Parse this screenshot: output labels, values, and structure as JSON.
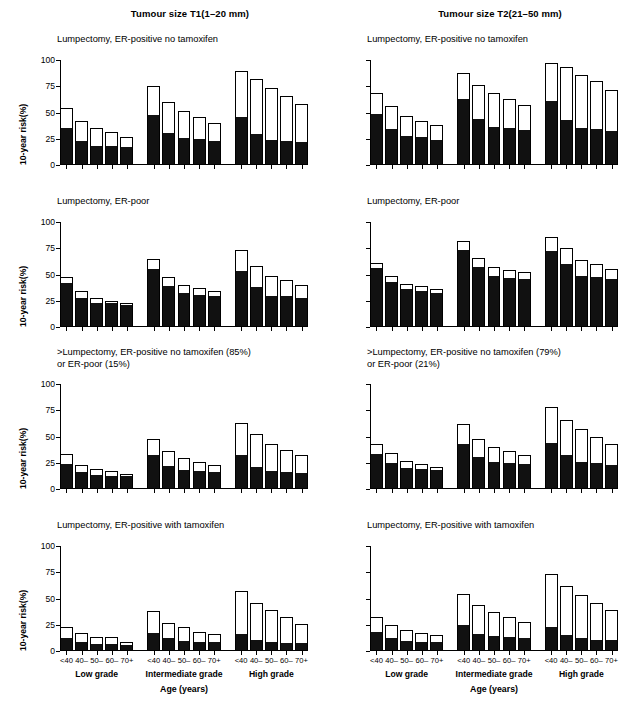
{
  "figure": {
    "columns": [
      {
        "title": "Tumour size T1(1–20 mm)"
      },
      {
        "title": "Tumour size T2(21–50 mm)"
      }
    ],
    "y_axis": {
      "label": "10-year risk(%)",
      "ticks": [
        "0",
        "25",
        "50",
        "75",
        "100"
      ],
      "min": 0,
      "max": 100
    },
    "x_axis": {
      "title": "Age (years)",
      "age_groups": [
        "<40",
        "40–",
        "50–",
        "60–",
        "70+"
      ],
      "grade_groups": [
        "Low grade",
        "Intermediate grade",
        "High grade"
      ]
    },
    "colors": {
      "bar_lower_segment": "#111111",
      "bar_upper_segment": "#ffffff",
      "bar_outline": "#000000",
      "axis": "#000000",
      "background": "#ffffff"
    },
    "row_titles": [
      "Lumpectomy, ER-positive no tamoxifen",
      "Lumpectomy, ER-poor",
      ">Lumpectomy, ER-positive no tamoxifen (85%)|or ER-poor (15%)",
      "Lumpectomy, ER-positive with tamoxifen"
    ]
  },
  "chart_data": [
    {
      "id": "t1-er-pos-no-tam",
      "type": "bar",
      "subtype": "stacked",
      "title": "Lumpectomy, ER-positive no tamoxifen",
      "column": "Tumour size T1(1–20 mm)",
      "xlabel": "Age (years)",
      "ylabel": "10-year risk(%)",
      "ylim": [
        0,
        100
      ],
      "yticks": [
        0,
        25,
        50,
        75,
        100
      ],
      "grid": false,
      "legend": "none",
      "categories": [
        "Low grade <40",
        "Low grade 40–",
        "Low grade 50–",
        "Low grade 60–",
        "Low grade 70+",
        "Intermediate grade <40",
        "Intermediate grade 40–",
        "Intermediate grade 50–",
        "Intermediate grade 60–",
        "Intermediate grade 70+",
        "High grade <40",
        "High grade 40–",
        "High grade 50–",
        "High grade 60–",
        "High grade 70+"
      ],
      "series": [
        {
          "name": "lower (solid black)",
          "values": [
            34,
            22,
            17,
            17,
            16,
            47,
            30,
            25,
            24,
            22,
            45,
            29,
            23,
            22,
            21
          ]
        },
        {
          "name": "total (bar top)",
          "values": [
            54,
            42,
            35,
            31,
            27,
            75,
            60,
            51,
            46,
            40,
            90,
            82,
            73,
            66,
            58
          ]
        }
      ]
    },
    {
      "id": "t2-er-pos-no-tam",
      "type": "bar",
      "subtype": "stacked",
      "title": "Lumpectomy, ER-positive no tamoxifen",
      "column": "Tumour size T2(21–50 mm)",
      "xlabel": "Age (years)",
      "ylabel": "10-year risk(%)",
      "ylim": [
        0,
        100
      ],
      "yticks": [
        0,
        25,
        50,
        75,
        100
      ],
      "grid": false,
      "legend": "none",
      "categories": [
        "Low grade <40",
        "Low grade 40–",
        "Low grade 50–",
        "Low grade 60–",
        "Low grade 70+",
        "Intermediate grade <40",
        "Intermediate grade 40–",
        "Intermediate grade 50–",
        "Intermediate grade 60–",
        "Intermediate grade 70+",
        "High grade <40",
        "High grade 40–",
        "High grade 50–",
        "High grade 60–",
        "High grade 70+"
      ],
      "series": [
        {
          "name": "lower (solid black)",
          "values": [
            48,
            33,
            27,
            26,
            23,
            62,
            43,
            35,
            34,
            32,
            60,
            42,
            34,
            33,
            31
          ]
        },
        {
          "name": "total (bar top)",
          "values": [
            69,
            56,
            47,
            42,
            38,
            88,
            76,
            69,
            63,
            57,
            97,
            93,
            86,
            80,
            71
          ]
        }
      ]
    },
    {
      "id": "t1-er-poor",
      "type": "bar",
      "subtype": "stacked",
      "title": "Lumpectomy, ER-poor",
      "column": "Tumour size T1(1–20 mm)",
      "xlabel": "Age (years)",
      "ylabel": "10-year risk(%)",
      "ylim": [
        0,
        100
      ],
      "yticks": [
        0,
        25,
        50,
        75,
        100
      ],
      "grid": false,
      "legend": "none",
      "categories": [
        "Low grade <40",
        "Low grade 40–",
        "Low grade 50–",
        "Low grade 60–",
        "Low grade 70+",
        "Intermediate grade <40",
        "Intermediate grade 40–",
        "Intermediate grade 50–",
        "Intermediate grade 60–",
        "Intermediate grade 70+",
        "High grade <40",
        "High grade 40–",
        "High grade 50–",
        "High grade 60–",
        "High grade 70+"
      ],
      "series": [
        {
          "name": "lower (solid black)",
          "values": [
            41,
            27,
            22,
            22,
            20,
            54,
            38,
            31,
            30,
            29,
            52,
            37,
            29,
            29,
            27
          ]
        },
        {
          "name": "total (bar top)",
          "values": [
            48,
            34,
            28,
            25,
            23,
            65,
            48,
            40,
            37,
            34,
            73,
            58,
            49,
            45,
            40
          ]
        }
      ]
    },
    {
      "id": "t2-er-poor",
      "type": "bar",
      "subtype": "stacked",
      "title": "Lumpectomy, ER-poor",
      "column": "Tumour size T2(21–50 mm)",
      "xlabel": "Age (years)",
      "ylabel": "10-year risk(%)",
      "ylim": [
        0,
        100
      ],
      "yticks": [
        0,
        25,
        50,
        75,
        100
      ],
      "grid": false,
      "legend": "none",
      "categories": [
        "Low grade <40",
        "Low grade 40–",
        "Low grade 50–",
        "Low grade 60–",
        "Low grade 70+",
        "Intermediate grade <40",
        "Intermediate grade 40–",
        "Intermediate grade 50–",
        "Intermediate grade 60–",
        "Intermediate grade 70+",
        "High grade <40",
        "High grade 40–",
        "High grade 50–",
        "High grade 60–",
        "High grade 70+"
      ],
      "series": [
        {
          "name": "lower (solid black)",
          "values": [
            55,
            42,
            35,
            33,
            31,
            72,
            56,
            48,
            46,
            45,
            71,
            59,
            48,
            47,
            45
          ]
        },
        {
          "name": "total (bar top)",
          "values": [
            61,
            49,
            41,
            39,
            36,
            82,
            66,
            57,
            54,
            52,
            86,
            75,
            64,
            60,
            55
          ]
        }
      ]
    },
    {
      "id": "t1-more-than-lumpectomy",
      "type": "bar",
      "subtype": "stacked",
      "title": ">Lumpectomy, ER-positive no tamoxifen (85%) or ER-poor (15%)",
      "column": "Tumour size T1(1–20 mm)",
      "xlabel": "Age (years)",
      "ylabel": "10-year risk(%)",
      "ylim": [
        0,
        100
      ],
      "yticks": [
        0,
        25,
        50,
        75,
        100
      ],
      "grid": false,
      "legend": "none",
      "categories": [
        "Low grade <40",
        "Low grade 40–",
        "Low grade 50–",
        "Low grade 60–",
        "Low grade 70+",
        "Intermediate grade <40",
        "Intermediate grade 40–",
        "Intermediate grade 50–",
        "Intermediate grade 60–",
        "Intermediate grade 70+",
        "High grade <40",
        "High grade 40–",
        "High grade 50–",
        "High grade 60–",
        "High grade 70+"
      ],
      "series": [
        {
          "name": "lower (solid black)",
          "values": [
            23,
            15,
            12,
            11,
            11,
            31,
            21,
            17,
            16,
            15,
            31,
            20,
            16,
            15,
            14
          ]
        },
        {
          "name": "total (bar top)",
          "values": [
            33,
            23,
            19,
            17,
            14,
            48,
            36,
            30,
            26,
            23,
            63,
            52,
            43,
            37,
            32
          ]
        }
      ]
    },
    {
      "id": "t2-more-than-lumpectomy",
      "type": "bar",
      "subtype": "stacked",
      "title": ">Lumpectomy, ER-positive no tamoxifen (79%) or ER-poor (21%)",
      "column": "Tumour size T2(21–50 mm)",
      "xlabel": "Age (years)",
      "ylabel": "10-year risk(%)",
      "ylim": [
        0,
        100
      ],
      "yticks": [
        0,
        25,
        50,
        75,
        100
      ],
      "grid": false,
      "legend": "none",
      "categories": [
        "Low grade <40",
        "Low grade 40–",
        "Low grade 50–",
        "Low grade 60–",
        "Low grade 70+",
        "Intermediate grade <40",
        "Intermediate grade 40–",
        "Intermediate grade 50–",
        "Intermediate grade 60–",
        "Intermediate grade 70+",
        "High grade <40",
        "High grade 40–",
        "High grade 50–",
        "High grade 60–",
        "High grade 70+"
      ],
      "series": [
        {
          "name": "lower (solid black)",
          "values": [
            32,
            24,
            19,
            18,
            17,
            42,
            30,
            25,
            24,
            23,
            43,
            31,
            25,
            24,
            22
          ]
        },
        {
          "name": "total (bar top)",
          "values": [
            43,
            34,
            27,
            24,
            21,
            62,
            48,
            40,
            36,
            32,
            78,
            66,
            57,
            50,
            43
          ]
        }
      ]
    },
    {
      "id": "t1-er-pos-with-tam",
      "type": "bar",
      "subtype": "stacked",
      "title": "Lumpectomy, ER-positive with tamoxifen",
      "column": "Tumour size T1(1–20 mm)",
      "xlabel": "Age (years)",
      "ylabel": "10-year risk(%)",
      "ylim": [
        0,
        100
      ],
      "yticks": [
        0,
        25,
        50,
        75,
        100
      ],
      "grid": false,
      "legend": "none",
      "categories": [
        "Low grade <40",
        "Low grade 40–",
        "Low grade 50–",
        "Low grade 60–",
        "Low grade 70+",
        "Intermediate grade <40",
        "Intermediate grade 40–",
        "Intermediate grade 50–",
        "Intermediate grade 60–",
        "Intermediate grade 70+",
        "High grade <40",
        "High grade 40–",
        "High grade 50–",
        "High grade 60–",
        "High grade 70+"
      ],
      "series": [
        {
          "name": "lower (solid black)",
          "values": [
            11,
            8,
            6,
            6,
            5,
            16,
            11,
            9,
            8,
            8,
            15,
            10,
            8,
            7,
            7
          ]
        },
        {
          "name": "total (bar top)",
          "values": [
            23,
            17,
            13,
            13,
            9,
            38,
            27,
            23,
            18,
            16,
            57,
            46,
            39,
            32,
            26
          ]
        }
      ]
    },
    {
      "id": "t2-er-pos-with-tam",
      "type": "bar",
      "subtype": "stacked",
      "title": "Lumpectomy, ER-positive with tamoxifen",
      "column": "Tumour size T2(21–50 mm)",
      "xlabel": "Age (years)",
      "ylabel": "10-year risk(%)",
      "ylim": [
        0,
        100
      ],
      "yticks": [
        0,
        25,
        50,
        75,
        100
      ],
      "grid": false,
      "legend": "none",
      "categories": [
        "Low grade <40",
        "Low grade 40–",
        "Low grade 50–",
        "Low grade 60–",
        "Low grade 70+",
        "Intermediate grade <40",
        "Intermediate grade 40–",
        "Intermediate grade 50–",
        "Intermediate grade 60–",
        "Intermediate grade 70+",
        "High grade <40",
        "High grade 40–",
        "High grade 50–",
        "High grade 60–",
        "High grade 70+"
      ],
      "series": [
        {
          "name": "lower (solid black)",
          "values": [
            17,
            11,
            9,
            8,
            8,
            24,
            15,
            13,
            12,
            11,
            22,
            14,
            11,
            10,
            10
          ]
        },
        {
          "name": "total (bar top)",
          "values": [
            32,
            25,
            20,
            17,
            15,
            54,
            44,
            37,
            32,
            28,
            73,
            62,
            53,
            46,
            39
          ]
        }
      ]
    }
  ]
}
